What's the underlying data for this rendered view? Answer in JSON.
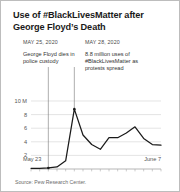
{
  "figure": {
    "title": "Use of #BlackLivesMatter after George Floyd’s Death",
    "source": "Source: Pew Research Center."
  },
  "annotations": [
    {
      "id": "annotation-floyd-death",
      "date": "MAY 25, 2020",
      "text": "George Floyd dies in police custody"
    },
    {
      "id": "annotation-peak-usage",
      "date": "MAY 28, 2020",
      "text": "8.8 million uses of #BlackLivesMatter as protests spread"
    }
  ],
  "axis": {
    "x_start_label": "May 23",
    "x_end_label": "June 7",
    "y_ticks": [
      "10 M",
      "8",
      "6",
      "4",
      "2"
    ]
  },
  "colors": {
    "line": "#1a1a1a",
    "grid": "#d8d8d8",
    "leader": "#666666",
    "border": "#bdbdbd",
    "text": "#333333"
  },
  "chart_data": {
    "type": "line",
    "title": "Use of #BlackLivesMatter after George Floyd’s Death",
    "xlabel": "",
    "ylabel": "Uses (millions)",
    "xlim": [
      "May 23",
      "June 7"
    ],
    "ylim": [
      0,
      10
    ],
    "grid": true,
    "legend": "none",
    "x": [
      "May 23",
      "May 24",
      "May 25",
      "May 26",
      "May 27",
      "May 28",
      "May 29",
      "May 30",
      "May 31",
      "June 1",
      "June 2",
      "June 3",
      "June 4",
      "June 5",
      "June 6",
      "June 7"
    ],
    "values": [
      0.1,
      0.1,
      0.15,
      0.3,
      1.2,
      8.8,
      5.0,
      3.6,
      2.9,
      4.6,
      4.6,
      5.3,
      6.2,
      4.5,
      3.6,
      3.5
    ],
    "series": [
      {
        "name": "#BlackLivesMatter uses",
        "values": [
          0.1,
          0.1,
          0.15,
          0.3,
          1.2,
          8.8,
          5.0,
          3.6,
          2.9,
          4.6,
          4.6,
          5.3,
          6.2,
          4.5,
          3.6,
          3.5
        ]
      }
    ],
    "markers": [
      {
        "label": "MAY 25, 2020",
        "x": "May 25",
        "y": 0.15
      },
      {
        "label": "MAY 28, 2020",
        "x": "May 28",
        "y": 8.8
      }
    ],
    "y_tick_values": [
      2,
      4,
      6,
      8,
      10
    ],
    "y_tick_labels": [
      "2",
      "4",
      "6",
      "8",
      "10 M"
    ]
  }
}
